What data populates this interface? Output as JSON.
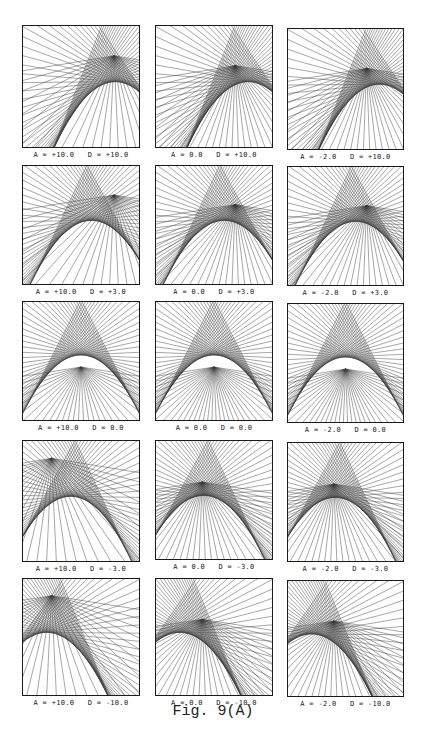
{
  "figure": {
    "caption": "Fig. 9(A)",
    "panels": [
      {
        "row": 0,
        "col": 0,
        "A": "+10.0",
        "D": "+10.0",
        "label": "A = +10.0   D = +10.0",
        "x": 22,
        "y": 25,
        "w": 118,
        "h": 123
      },
      {
        "row": 0,
        "col": 1,
        "A": "0.0",
        "D": "+10.0",
        "label": "A = 0.0   D = +10.0",
        "x": 155,
        "y": 25,
        "w": 118,
        "h": 123
      },
      {
        "row": 0,
        "col": 2,
        "A": "-2.0",
        "D": "+10.0",
        "label": "A = -2.0   D = +10.0",
        "x": 287,
        "y": 28,
        "w": 117,
        "h": 122
      },
      {
        "row": 1,
        "col": 0,
        "A": "+10.0",
        "D": "+3.0",
        "label": "A = +10.0   D = +3.0",
        "x": 22,
        "y": 165,
        "w": 118,
        "h": 120
      },
      {
        "row": 1,
        "col": 1,
        "A": "0.0",
        "D": "+3.0",
        "label": "A = 0.0   D = +3.0",
        "x": 155,
        "y": 165,
        "w": 118,
        "h": 120
      },
      {
        "row": 1,
        "col": 2,
        "A": "-2.0",
        "D": "+3.0",
        "label": "A = -2.0   D = +3.0",
        "x": 287,
        "y": 166,
        "w": 117,
        "h": 120
      },
      {
        "row": 2,
        "col": 0,
        "A": "+10.0",
        "D": "0.0",
        "label": "A = +10.0   D = 0.0",
        "x": 22,
        "y": 301,
        "w": 118,
        "h": 120
      },
      {
        "row": 2,
        "col": 1,
        "A": "0.0",
        "D": "0.0",
        "label": "A = 0.0   D = 0.0",
        "x": 155,
        "y": 301,
        "w": 118,
        "h": 120
      },
      {
        "row": 2,
        "col": 2,
        "A": "-2.0",
        "D": "0.0",
        "label": "A = -2.0   D = 0.0",
        "x": 287,
        "y": 303,
        "w": 117,
        "h": 120
      },
      {
        "row": 3,
        "col": 0,
        "A": "+10.0",
        "D": "-3.0",
        "label": "A = +10.0   D = -3.0",
        "x": 22,
        "y": 440,
        "w": 118,
        "h": 122
      },
      {
        "row": 3,
        "col": 1,
        "A": "0.0",
        "D": "-3.0",
        "label": "A = 0.0   D = -3.0",
        "x": 155,
        "y": 440,
        "w": 118,
        "h": 120
      },
      {
        "row": 3,
        "col": 2,
        "A": "-2.0",
        "D": "-3.0",
        "label": "A = -2.0   D = -3.0",
        "x": 287,
        "y": 442,
        "w": 117,
        "h": 120
      },
      {
        "row": 4,
        "col": 0,
        "A": "+10.0",
        "D": "-10.0",
        "label": "A = +10.0   D = -10.0",
        "x": 22,
        "y": 578,
        "w": 118,
        "h": 118
      },
      {
        "row": 4,
        "col": 1,
        "A": "0.0",
        "D": "-10.0",
        "label": "A = 0.0   D = -10.0",
        "x": 155,
        "y": 578,
        "w": 118,
        "h": 118
      },
      {
        "row": 4,
        "col": 2,
        "A": "-2.0",
        "D": "-10.0",
        "label": "A = -2.0   D = -10.0",
        "x": 287,
        "y": 580,
        "w": 117,
        "h": 117
      }
    ]
  },
  "style": {
    "ink": "#1a1a1a",
    "paper": "#ffffff"
  }
}
